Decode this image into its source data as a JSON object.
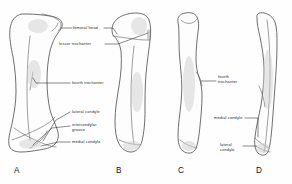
{
  "figure": {
    "background_color": "#fefefe",
    "line_color": "#4a4a4a",
    "text_color": "#1e1e1e"
  },
  "labels": {
    "femoral_head": "femoral head",
    "lesser_trochanter": "lesser trochanter",
    "fourth_trochanter_left": "fourth trochanter",
    "fourth_trochanter_right_line1": "fourth",
    "fourth_trochanter_right_line2": "trochanter",
    "lateral_condyle_left": "lateral  condyle",
    "intercondylar_groove_line1": "intercondylar",
    "intercondylar_groove_line2": "groove",
    "medial_condyle_left": "medial  condyle",
    "medial_condyle_right": "medial  condyle",
    "lateral_condyle_right_line1": "lateral",
    "lateral_condyle_right_line2": "condyle"
  },
  "panels": [
    {
      "letter": "A",
      "view": "anterior-femur"
    },
    {
      "letter": "B",
      "view": "posterior-femur"
    },
    {
      "letter": "C",
      "view": "medial-femur"
    },
    {
      "letter": "D",
      "view": "lateral-femur"
    }
  ]
}
